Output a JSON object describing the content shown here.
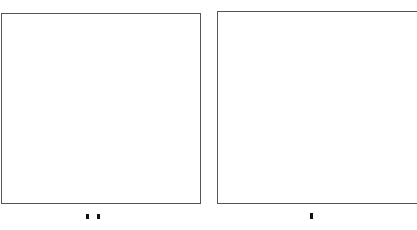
{
  "panels": [
    {
      "id": "left",
      "content": ""
    },
    {
      "id": "right",
      "content": ""
    }
  ],
  "captions": {
    "left": "",
    "right": ""
  },
  "colors": {
    "frame": "#555555",
    "background": "#ffffff",
    "text": "#111111"
  }
}
